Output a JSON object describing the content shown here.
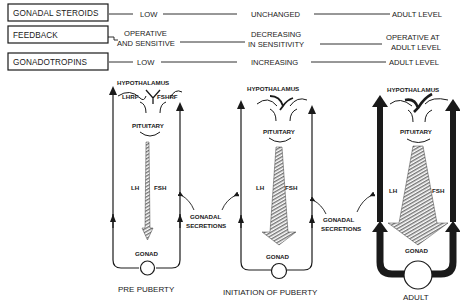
{
  "rows": [
    {
      "label": "GONADAL STEROIDS",
      "pre_puberty": [
        "LOW"
      ],
      "initiation": [
        "UNCHANGED"
      ],
      "adult": [
        "ADULT LEVEL"
      ]
    },
    {
      "label": "FEEDBACK",
      "pre_puberty": [
        "OPERATIVE",
        "AND SENSITIVE"
      ],
      "initiation": [
        "DECREASING",
        "IN SENSITIVITY"
      ],
      "adult": [
        "OPERATIVE AT",
        "ADULT LEVEL"
      ]
    },
    {
      "label": "GONADOTROPINS",
      "pre_puberty": [
        "LOW"
      ],
      "initiation": [
        "INCREASING"
      ],
      "adult": [
        "ADULT LEVEL"
      ]
    }
  ],
  "panels": [
    {
      "caption": "PRE PUBERTY",
      "hypothalamus": "HYPOTHALAMUS",
      "releasing_factors": [
        "LHRF",
        "FSHRF"
      ],
      "pituitary": "PITUITARY",
      "lh": "LH",
      "fsh": "FSH",
      "gonad": "GONAD"
    },
    {
      "caption": "INITIATION OF PUBERTY",
      "hypothalamus": "HYPOTHALAMUS",
      "pituitary": "PITUITARY",
      "lh": "LH",
      "fsh": "FSH",
      "gonad": "GONAD"
    },
    {
      "caption": "ADULT",
      "hypothalamus": "HYPOTHALAMUS",
      "pituitary": "PITUITARY",
      "lh": "LH",
      "fsh": "FSH",
      "gonad": "GONAD"
    }
  ],
  "secretions": [
    {
      "line1": "GONADAL",
      "line2": "SECRETIONS"
    },
    {
      "line1": "GONADAL",
      "line2": "SECRETIONS"
    }
  ]
}
